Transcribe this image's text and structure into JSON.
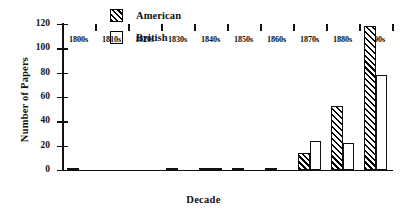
{
  "chart_data": {
    "type": "bar",
    "title": "",
    "xlabel": "Decade",
    "ylabel": "Number of Papers",
    "categories": [
      "1800s",
      "1810s",
      "1820s",
      "1830s",
      "1840s",
      "1850s",
      "1860s",
      "1870s",
      "1880s",
      "1890s"
    ],
    "series": [
      {
        "name": "American",
        "values": [
          1,
          0,
          0,
          1,
          2,
          1,
          2,
          14,
          53,
          118
        ],
        "pattern": "diagonal-hatch",
        "fill": "#ffffff",
        "edge": "#000000"
      },
      {
        "name": "British",
        "values": [
          0,
          0,
          0,
          0,
          2,
          0,
          0,
          24,
          22,
          78
        ],
        "pattern": "solid",
        "fill": "#ffffff",
        "edge": "#000000"
      }
    ],
    "ylim": [
      0,
      120
    ],
    "yticks": [
      0,
      20,
      40,
      60,
      80,
      100,
      120
    ],
    "ytick_labels": [
      "0",
      "20",
      "40",
      "60",
      "80",
      "100",
      "120"
    ],
    "grid": false,
    "legend_position": "top-center"
  },
  "legend": {
    "entries": [
      {
        "label": "American",
        "swatch": "hatched-swatch-icon"
      },
      {
        "label": "British",
        "swatch": "open-swatch-icon"
      }
    ]
  },
  "axes": {
    "x_title": "Decade",
    "y_title": "Number of Papers"
  }
}
